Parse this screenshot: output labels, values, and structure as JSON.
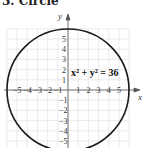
{
  "title": "3. Circle",
  "chart_data": {
    "type": "line",
    "title": "3. Circle",
    "equation": "x² + y² = 36",
    "shape": "circle",
    "center": [
      0,
      0
    ],
    "radius": 6,
    "xlabel": "x",
    "ylabel": "y",
    "xlim": [
      -6,
      6
    ],
    "ylim": [
      -6,
      6
    ],
    "grid": true,
    "x_ticks": [
      "-5",
      "-4",
      "-3",
      "-2",
      "-1",
      "1",
      "2",
      "3",
      "4",
      "5"
    ],
    "y_ticks": [
      "5",
      "4",
      "3",
      "2",
      "1",
      "-1",
      "-2",
      "-3",
      "-4",
      "-5"
    ],
    "colors": {
      "curve": "#1a1a1a",
      "axes": "#555555",
      "grid": "#d8d8d8"
    }
  }
}
